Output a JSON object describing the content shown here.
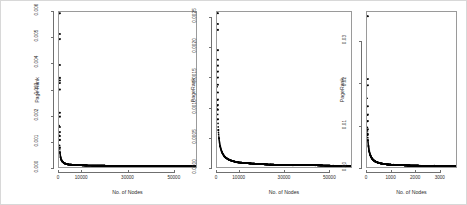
{
  "figure": {
    "background": "#ffffff",
    "border_color": "#d8d8d8",
    "frame_color": "#9a9a9a",
    "point_color": "#000000",
    "panel_count": 3
  },
  "chart_data": [
    {
      "type": "scatter",
      "title": "",
      "xlabel": "No. of Nodes",
      "ylabel": "Page Rank",
      "xticks": [
        "0",
        "10000",
        "30000",
        "50000"
      ],
      "xtick_values": [
        0,
        10000,
        30000,
        50000
      ],
      "yticks": [
        "0.000",
        "0.001",
        "0.002",
        "0.003",
        "0.004",
        "0.005",
        "0.006"
      ],
      "ytick_values": [
        0.0,
        0.001,
        0.002,
        0.003,
        0.004,
        0.005,
        0.006
      ],
      "xlim": [
        0,
        60000
      ],
      "ylim": [
        0,
        0.006
      ],
      "grid": false,
      "legend": "none",
      "description": "Sorted PageRank values decay steeply from a maximum near 0.006 to a near-zero floor; the dense mass of points lies along the x-axis baseline.",
      "x": [
        1,
        2,
        3,
        5,
        8,
        12,
        18,
        25,
        35,
        50,
        70,
        100,
        140,
        200,
        300,
        450,
        700,
        1000,
        1600,
        2500,
        4000,
        7000,
        12000,
        20000,
        30000,
        40000,
        50000,
        58000
      ],
      "y": [
        0.00595,
        0.00515,
        0.00495,
        0.00395,
        0.00345,
        0.00335,
        0.00325,
        0.003,
        0.0021,
        0.00195,
        0.00155,
        0.00135,
        0.0012,
        0.00105,
        0.00075,
        0.00055,
        0.00038,
        0.00028,
        0.0002,
        0.00014,
        0.0001,
        8e-05,
        6e-05,
        5e-05,
        4e-05,
        4e-05,
        3e-05,
        3e-05
      ]
    },
    {
      "type": "scatter",
      "title": "",
      "xlabel": "No. of Nodes",
      "ylabel": "PageRank",
      "xticks": [
        "0",
        "10000",
        "30000",
        "50000"
      ],
      "xtick_values": [
        0,
        10000,
        30000,
        50000
      ],
      "yticks": [
        "0.0000",
        "0.0005",
        "0.0010",
        "0.0015",
        "0.0020",
        "0.0025"
      ],
      "ytick_values": [
        0.0,
        0.0005,
        0.001,
        0.0015,
        0.002,
        0.0025
      ],
      "xlim": [
        0,
        60000
      ],
      "ylim": [
        0,
        0.0026
      ],
      "grid": false,
      "legend": "none",
      "description": "Sorted PageRank values decay steeply from about 0.0026 to a near-zero floor with a dense baseline cluster.",
      "x": [
        1,
        2,
        4,
        7,
        11,
        17,
        26,
        40,
        60,
        90,
        130,
        190,
        280,
        400,
        600,
        900,
        1400,
        2200,
        3500,
        5500,
        9000,
        15000,
        24000,
        34000,
        44000,
        52000,
        58000
      ],
      "y": [
        0.00258,
        0.0024,
        0.0023,
        0.00196,
        0.0018,
        0.0017,
        0.0016,
        0.0015,
        0.00138,
        0.00125,
        0.00113,
        0.00104,
        0.00096,
        0.0008,
        0.00062,
        0.00048,
        0.00035,
        0.00025,
        0.00017,
        0.00012,
        8e-05,
        6e-05,
        4e-05,
        3e-05,
        3e-05,
        2e-05,
        2e-05
      ]
    },
    {
      "type": "scatter",
      "title": "",
      "xlabel": "No. of Nodes",
      "ylabel": "PageRank",
      "xticks": [
        "0",
        "1000",
        "2000",
        "3000"
      ],
      "xtick_values": [
        0,
        1000,
        2000,
        3000
      ],
      "yticks": [
        "0.00",
        "0.01",
        "0.02",
        "0.03"
      ],
      "ytick_values": [
        0.0,
        0.01,
        0.02,
        0.03
      ],
      "xlim": [
        0,
        3700
      ],
      "ylim": [
        0,
        0.037
      ],
      "grid": false,
      "legend": "none",
      "description": "Sorted PageRank values for a smaller graph decay steeply from about 0.036 to a near-zero floor.",
      "x": [
        1,
        2,
        3,
        5,
        8,
        12,
        18,
        27,
        40,
        60,
        90,
        140,
        210,
        320,
        480,
        720,
        1100,
        1600,
        2200,
        2800,
        3300,
        3650
      ],
      "y": [
        0.036,
        0.021,
        0.0195,
        0.0145,
        0.0125,
        0.011,
        0.009,
        0.0078,
        0.0063,
        0.005,
        0.0038,
        0.0028,
        0.002,
        0.0014,
        0.001,
        0.0007,
        0.0005,
        0.0004,
        0.0003,
        0.0003,
        0.0002,
        0.0002
      ]
    }
  ]
}
